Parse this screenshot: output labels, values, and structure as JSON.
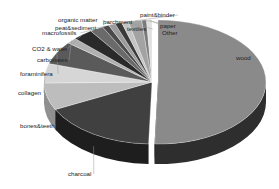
{
  "chart_data": {
    "type": "pie",
    "style": "3d-exploded",
    "title": "",
    "legend": "none",
    "labels_position": "outside-with-leader-lines",
    "slices": [
      {
        "label": "wood",
        "value": 50.0,
        "color": "#8a8a8a",
        "side": "#2e2e2e",
        "explode": 6
      },
      {
        "label": "charcoal",
        "value": 17.0,
        "color": "#404040",
        "side": "#1e1e1e",
        "explode": 0
      },
      {
        "label": "bones&teeth",
        "value": 7.0,
        "color": "#bdbdbd",
        "side": "#8f8f8f",
        "explode": 0
      },
      {
        "label": "collagen",
        "value": 5.0,
        "color": "#d6d6d6",
        "side": "#a8a8a8",
        "explode": 0
      },
      {
        "label": "foraminifera",
        "value": 6.0,
        "color": "#5a5a5a",
        "side": "#333333",
        "explode": 0
      },
      {
        "label": "carbonates",
        "value": 1.5,
        "color": "#b0b0b0",
        "side": "#808080",
        "explode": 0
      },
      {
        "label": "CO2 & water",
        "value": 3.0,
        "color": "#2a2a2a",
        "side": "#151515",
        "explode": 0
      },
      {
        "label": "macrofossils",
        "value": 2.0,
        "color": "#6a6a6a",
        "side": "#3d3d3d",
        "explode": 0
      },
      {
        "label": "peat&sediment",
        "value": 1.0,
        "color": "#4a4a4a",
        "side": "#2a2a2a",
        "explode": 0
      },
      {
        "label": "organic matter",
        "value": 1.0,
        "color": "#9c9c9c",
        "side": "#6c6c6c",
        "explode": 0
      },
      {
        "label": "parchment",
        "value": 1.0,
        "color": "#3a3a3a",
        "side": "#222222",
        "explode": 0
      },
      {
        "label": "textiles",
        "value": 1.0,
        "color": "#c4c4c4",
        "side": "#949494",
        "explode": 0
      },
      {
        "label": "paint&binder",
        "value": 2.0,
        "color": "#a3a3a3",
        "side": "#737373",
        "explode": 0
      },
      {
        "label": "paper",
        "value": 0.7,
        "color": "#7a7a7a",
        "side": "#4a4a4a",
        "explode": 0
      },
      {
        "label": "Other",
        "value": 0.8,
        "color": "#e0e0e0",
        "side": "#b0b0b0",
        "explode": 0
      }
    ]
  },
  "label_positions": {
    "wood": [
      236,
      60,
      "start"
    ],
    "charcoal": [
      68,
      176,
      "start"
    ],
    "bones&teeth": [
      20,
      128,
      "start"
    ],
    "collagen": [
      18,
      95,
      "start"
    ],
    "foraminifera": [
      20,
      76,
      "start"
    ],
    "carbonates": [
      37,
      62,
      "start"
    ],
    "CO2 & water": [
      32,
      51,
      "start"
    ],
    "macrofossils": [
      42,
      35,
      "start"
    ],
    "peat&sediment": [
      55,
      30,
      "start"
    ],
    "organic matter": [
      58,
      22,
      "start"
    ],
    "parchment": [
      103,
      24,
      "start"
    ],
    "textiles": [
      127,
      31,
      "start"
    ],
    "paint&binder": [
      140,
      17,
      "start"
    ],
    "paper": [
      160,
      28,
      "start"
    ],
    "Other": [
      162,
      35,
      "start"
    ]
  }
}
